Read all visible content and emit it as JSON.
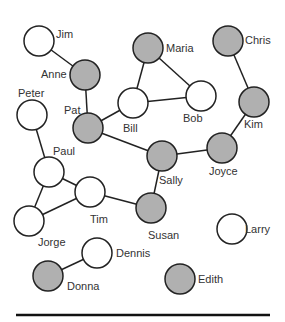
{
  "diagram": {
    "type": "social-network-graph",
    "colors": {
      "filled": "#b0b0b0",
      "empty": "#ffffff",
      "stroke": "#222222",
      "text": "#333333"
    },
    "node_radius": 15,
    "nodes": [
      {
        "id": "jim",
        "label": "Jim",
        "x": 39,
        "y": 41,
        "filled": false,
        "lx": 56,
        "ly": 38,
        "anchor": "start"
      },
      {
        "id": "anne",
        "label": "Anne",
        "x": 85,
        "y": 75,
        "filled": true,
        "lx": 41,
        "ly": 78,
        "anchor": "start"
      },
      {
        "id": "maria",
        "label": "Maria",
        "x": 148,
        "y": 48,
        "filled": true,
        "lx": 166,
        "ly": 52,
        "anchor": "start"
      },
      {
        "id": "chris",
        "label": "Chris",
        "x": 228,
        "y": 41,
        "filled": true,
        "lx": 245,
        "ly": 44,
        "anchor": "start"
      },
      {
        "id": "peter",
        "label": "Peter",
        "x": 32,
        "y": 115,
        "filled": false,
        "lx": 18,
        "ly": 97,
        "anchor": "start"
      },
      {
        "id": "pat",
        "label": "Pat",
        "x": 88,
        "y": 128,
        "filled": true,
        "lx": 64,
        "ly": 114,
        "anchor": "start"
      },
      {
        "id": "bill",
        "label": "Bill",
        "x": 133,
        "y": 103,
        "filled": false,
        "lx": 123,
        "ly": 132,
        "anchor": "start"
      },
      {
        "id": "bob",
        "label": "Bob",
        "x": 201,
        "y": 96,
        "filled": false,
        "lx": 183,
        "ly": 122,
        "anchor": "start"
      },
      {
        "id": "kim",
        "label": "Kim",
        "x": 254,
        "y": 102,
        "filled": true,
        "lx": 244,
        "ly": 128,
        "anchor": "start"
      },
      {
        "id": "paul",
        "label": "Paul",
        "x": 49,
        "y": 172,
        "filled": false,
        "lx": 53,
        "ly": 155,
        "anchor": "start"
      },
      {
        "id": "sally",
        "label": "Sally",
        "x": 162,
        "y": 156,
        "filled": true,
        "lx": 159,
        "ly": 184,
        "anchor": "start"
      },
      {
        "id": "joyce",
        "label": "Joyce",
        "x": 222,
        "y": 148,
        "filled": true,
        "lx": 209,
        "ly": 175,
        "anchor": "start"
      },
      {
        "id": "tim",
        "label": "Tim",
        "x": 90,
        "y": 192,
        "filled": false,
        "lx": 90,
        "ly": 223,
        "anchor": "start"
      },
      {
        "id": "jorge",
        "label": "Jorge",
        "x": 29,
        "y": 221,
        "filled": false,
        "lx": 38,
        "ly": 246,
        "anchor": "start"
      },
      {
        "id": "susan",
        "label": "Susan",
        "x": 151,
        "y": 208,
        "filled": true,
        "lx": 148,
        "ly": 239,
        "anchor": "start"
      },
      {
        "id": "larry",
        "label": "Larry",
        "x": 232,
        "y": 229,
        "filled": false,
        "lx": 245,
        "ly": 233,
        "anchor": "start"
      },
      {
        "id": "dennis",
        "label": "Dennis",
        "x": 97,
        "y": 253,
        "filled": false,
        "lx": 116,
        "ly": 257,
        "anchor": "start"
      },
      {
        "id": "donna",
        "label": "Donna",
        "x": 48,
        "y": 276,
        "filled": true,
        "lx": 67,
        "ly": 290,
        "anchor": "start"
      },
      {
        "id": "edith",
        "label": "Edith",
        "x": 180,
        "y": 279,
        "filled": true,
        "lx": 198,
        "ly": 283,
        "anchor": "start"
      }
    ],
    "edges": [
      [
        "jim",
        "anne"
      ],
      [
        "anne",
        "pat"
      ],
      [
        "pat",
        "bill"
      ],
      [
        "bill",
        "maria"
      ],
      [
        "bill",
        "bob"
      ],
      [
        "maria",
        "bob"
      ],
      [
        "pat",
        "sally"
      ],
      [
        "sally",
        "joyce"
      ],
      [
        "joyce",
        "kim"
      ],
      [
        "kim",
        "chris"
      ],
      [
        "sally",
        "susan"
      ],
      [
        "susan",
        "tim"
      ],
      [
        "peter",
        "paul"
      ],
      [
        "paul",
        "tim"
      ],
      [
        "paul",
        "jorge"
      ],
      [
        "jorge",
        "tim"
      ],
      [
        "dennis",
        "donna"
      ]
    ],
    "baseline": {
      "x1": 16,
      "x2": 270,
      "y": 315
    }
  }
}
